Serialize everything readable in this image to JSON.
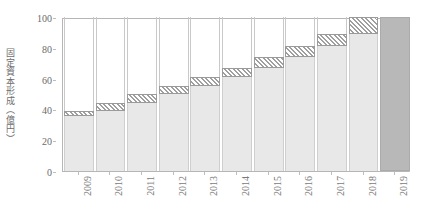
{
  "chart_data": {
    "type": "bar",
    "title": "",
    "subtitle": "",
    "xlabel": "",
    "ylabel": "固定資本形成（億円）",
    "categories": [
      "2009",
      "2010",
      "2011",
      "2012",
      "2013",
      "2014",
      "2015",
      "2016",
      "2017",
      "2018",
      "2019"
    ],
    "ylim": [
      0,
      100
    ],
    "xlim_note": "categorical, 11 year slots",
    "y_ticks": [
      0,
      20,
      40,
      60,
      80,
      100
    ],
    "y_tick_labels": [
      "0",
      "20",
      "40",
      "60",
      "80",
      "100"
    ],
    "grid": false,
    "legend": "none",
    "legend_position": "none",
    "series": [
      {
        "name": "累積（前年までの合計）",
        "style": "solid-light-gray",
        "values": [
          36,
          39,
          44,
          50,
          55,
          61,
          67,
          74,
          81,
          89,
          0
        ]
      },
      {
        "name": "当年増分（ハッチ）",
        "style": "hatched",
        "values": [
          3,
          5,
          6,
          5,
          6,
          6,
          7,
          7,
          8,
          11,
          0
        ]
      },
      {
        "name": "合計",
        "style": "solid-dark-gray",
        "values": [
          0,
          0,
          0,
          0,
          0,
          0,
          0,
          0,
          0,
          0,
          100
        ]
      }
    ],
    "cumulative_totals": [
      39,
      44,
      50,
      55,
      61,
      67,
      74,
      81,
      89,
      100,
      100
    ],
    "colors": {
      "base_fill": "#e8e8e8",
      "base_edge": "#cfcfcf",
      "hatch_fill": "#fbfbfb",
      "hatch_line": "#9f9f9f",
      "hatch_edge": "#9a9a9a",
      "total_fill": "#b8b8b8",
      "total_edge": "#ababab",
      "axis": "#b6b6b6",
      "tick_text": "#6a6a6a",
      "axis_title_text": "#6e6e6e",
      "background": "#ffffff"
    }
  },
  "axis": {
    "y_title": "固定資本形成（億円）",
    "y_labels": [
      "100",
      "80",
      "60",
      "40",
      "20",
      "0"
    ],
    "x_labels": [
      "2009",
      "2010",
      "2011",
      "2012",
      "2013",
      "2014",
      "2015",
      "2016",
      "2017",
      "2018",
      "2019"
    ]
  }
}
